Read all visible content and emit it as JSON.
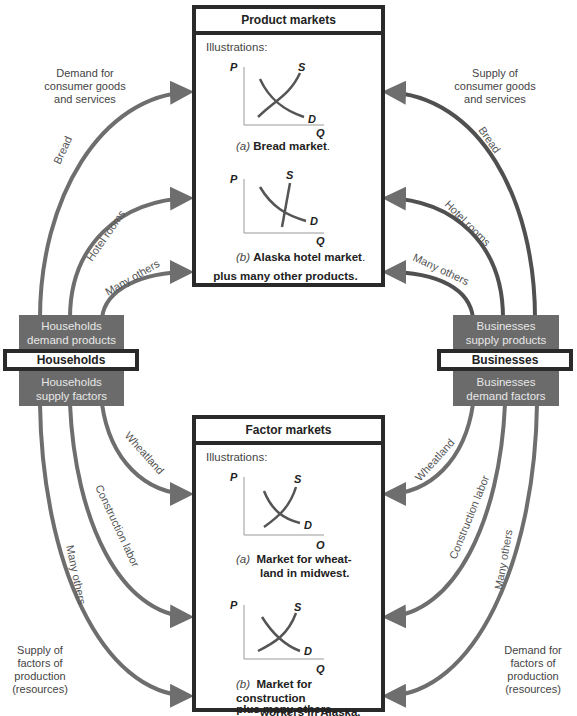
{
  "product_markets": {
    "title": "Product markets",
    "illustrations_label": "Illustrations:",
    "chart_a": {
      "letter": "(a)",
      "caption": "Bread market",
      "p": "P",
      "q": "Q",
      "s": "S",
      "d": "D"
    },
    "chart_b": {
      "letter": "(b)",
      "caption": "Alaska hotel market",
      "p": "P",
      "q": "Q",
      "s": "S",
      "d": "D"
    },
    "footer": "plus many other products"
  },
  "factor_markets": {
    "title": "Factor markets",
    "illustrations_label": "Illustrations:",
    "chart_a": {
      "letter": "(a)",
      "caption_line1": "Market for wheat-",
      "caption_line2": "land in midwest.",
      "p": "P",
      "q": "Q",
      "s": "S",
      "d": "D"
    },
    "chart_b": {
      "letter": "(b)",
      "caption_line1": "Market for construction",
      "caption_line2": "workers in Alaska.",
      "p": "P",
      "q": "Q",
      "s": "S",
      "d": "D"
    },
    "footer": "plus many others"
  },
  "households": {
    "label": "Households",
    "demand_line1": "Households",
    "demand_line2": "demand products",
    "supply_line1": "Households",
    "supply_line2": "supply factors"
  },
  "businesses": {
    "label": "Businesses",
    "supply_line1": "Businesses",
    "supply_line2": "supply products",
    "demand_line1": "Businesses",
    "demand_line2": "demand factors"
  },
  "corners": {
    "top_left": [
      "Demand for",
      "consumer goods",
      "and services"
    ],
    "top_right": [
      "Supply of",
      "consumer goods",
      "and services"
    ],
    "bottom_left": [
      "Supply of",
      "factors of",
      "production",
      "(resources)"
    ],
    "bottom_right": [
      "Demand for",
      "factors of",
      "production",
      "(resources)"
    ]
  },
  "flows": {
    "left_top": [
      "Bread",
      "Hotel rooms",
      "Many others"
    ],
    "right_top": [
      "Bread",
      "Hotel rooms",
      "Many others"
    ],
    "left_bottom": [
      "Wheatland",
      "Construction labor",
      "Many others"
    ],
    "right_bottom": [
      "Wheatland",
      "Construction labor",
      "Many others"
    ]
  },
  "colors": {
    "arrow": "#6e6e6e",
    "box_border": "#2a2a2a",
    "agent_block": "#6b6b6b"
  }
}
